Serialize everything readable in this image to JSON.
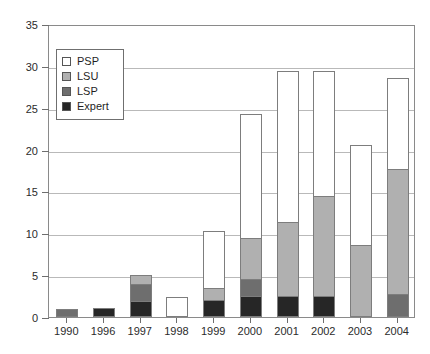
{
  "chart_data": {
    "type": "bar",
    "subtype": "stacked",
    "title": "",
    "xlabel": "",
    "ylabel": "",
    "categories": [
      "1990",
      "1996",
      "1997",
      "1998",
      "1999",
      "2000",
      "2001",
      "2002",
      "2003",
      "2004"
    ],
    "ylim": [
      0,
      35
    ],
    "yticks": [
      0,
      5,
      10,
      15,
      20,
      25,
      30,
      35
    ],
    "grid": true,
    "legend_position": "upper-left-inside",
    "series": [
      {
        "name": "Expert",
        "color": "#262626",
        "values": [
          0,
          1.1,
          1.9,
          0,
          2.0,
          2.5,
          2.5,
          2.5,
          0,
          0
        ]
      },
      {
        "name": "LSP",
        "color": "#6e6e6e",
        "values": [
          1.0,
          0,
          2.1,
          0,
          0,
          2.0,
          0,
          0,
          0,
          2.7
        ]
      },
      {
        "name": "LSU",
        "color": "#b0b0b0",
        "values": [
          0,
          0,
          1.0,
          0,
          1.5,
          4.9,
          8.9,
          11.9,
          8.6,
          15.0
        ]
      },
      {
        "name": "PSP",
        "color": "#ffffff",
        "values": [
          0,
          0,
          0,
          2.4,
          6.8,
          14.9,
          18.0,
          15.0,
          11.9,
          10.9
        ]
      }
    ],
    "totals": [
      1.0,
      1.1,
      5.0,
      2.4,
      10.3,
      24.3,
      29.4,
      29.4,
      20.5,
      28.6
    ]
  },
  "legend": {
    "items": [
      {
        "label": "PSP",
        "color": "#ffffff"
      },
      {
        "label": "LSU",
        "color": "#b0b0b0"
      },
      {
        "label": "LSP",
        "color": "#6e6e6e"
      },
      {
        "label": "Expert",
        "color": "#262626"
      }
    ]
  },
  "colors": {
    "axis": "#6e6e6e",
    "grid": "#b9b9b9",
    "frame": "#8a8a8a",
    "text": "#2b2b2b",
    "bar_outline": "#7d7d7d",
    "background": "#ffffff"
  }
}
